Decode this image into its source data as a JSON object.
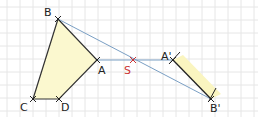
{
  "diagram": {
    "colors": {
      "grid": "#e4e4e4",
      "fill": "#fbf8cf",
      "fill_partial": "#f8f3b8",
      "edge": "#333333",
      "ray": "#7a9fc4",
      "center": "#cc3333",
      "label": "#222222"
    },
    "points": {
      "B": {
        "label": "B",
        "x": 58,
        "y": 19
      },
      "A": {
        "label": "A",
        "x": 97,
        "y": 60
      },
      "C": {
        "label": "C",
        "x": 33,
        "y": 99
      },
      "D": {
        "label": "D",
        "x": 59,
        "y": 99
      },
      "S": {
        "label": "S",
        "x": 133,
        "y": 60
      },
      "A2": {
        "label": "A'",
        "x": 173,
        "y": 60
      },
      "B2": {
        "label": "B'",
        "x": 211,
        "y": 99
      }
    }
  }
}
